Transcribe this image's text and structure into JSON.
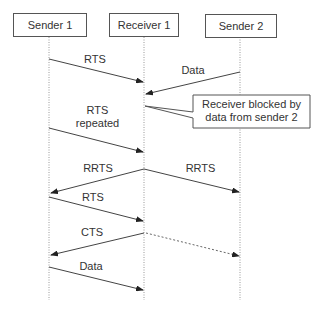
{
  "diagram": {
    "type": "sequence",
    "participants": [
      {
        "id": "sender1",
        "label": "Sender 1"
      },
      {
        "id": "receiver1",
        "label": "Receiver 1"
      },
      {
        "id": "sender2",
        "label": "Sender 2"
      }
    ],
    "messages": [
      {
        "from": "sender1",
        "to": "receiver1",
        "label": "RTS",
        "style": "solid"
      },
      {
        "from": "sender2",
        "to": "receiver1",
        "label": "Data",
        "style": "solid"
      },
      {
        "from": "sender1",
        "to": "receiver1",
        "label_line1": "RTS",
        "label_line2": "repeated",
        "style": "solid"
      },
      {
        "from": "receiver1",
        "to": "sender1",
        "label": "RRTS",
        "style": "solid"
      },
      {
        "from": "receiver1",
        "to": "sender2",
        "label": "RRTS",
        "style": "solid"
      },
      {
        "from": "sender1",
        "to": "receiver1",
        "label": "RTS",
        "style": "solid"
      },
      {
        "from": "receiver1",
        "to": "sender1",
        "label": "CTS",
        "style": "solid"
      },
      {
        "from": "receiver1",
        "to": "sender2",
        "label": "",
        "style": "dashed"
      },
      {
        "from": "sender1",
        "to": "receiver1",
        "label": "Data",
        "style": "solid"
      }
    ],
    "callout": {
      "line1": "Receiver blocked by",
      "line2": "data from sender 2"
    }
  }
}
